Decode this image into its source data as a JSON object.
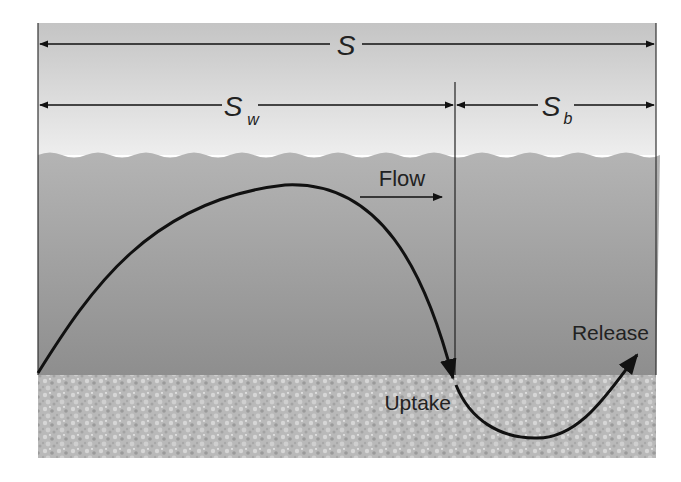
{
  "diagram": {
    "labels": {
      "total_length": "S",
      "water_length_main": "S",
      "water_length_sub": "w",
      "benthic_length_main": "S",
      "benthic_length_sub": "b",
      "flow": "Flow",
      "uptake": "Uptake",
      "release": "Release"
    },
    "regions": [
      "air",
      "water column",
      "sediment bed"
    ],
    "colors": {
      "air_top": "#c6c6c6",
      "air_bottom": "#ececec",
      "water_top": "#b2b2b2",
      "water_bottom": "#8f8f8f",
      "sediment": "#bdbdbd",
      "line": "#111111"
    }
  }
}
